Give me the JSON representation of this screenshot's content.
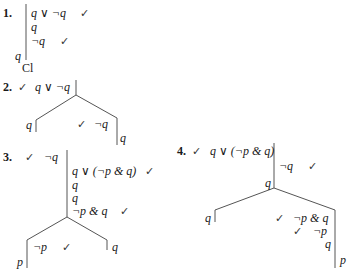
{
  "trees": [
    {
      "number": "1.",
      "nodes": [
        "q ∨ ¬q",
        "q",
        "¬q",
        "q",
        "Cl"
      ],
      "checks": [
        "✓",
        "✓"
      ]
    },
    {
      "number": "2.",
      "root": "q ∨ ¬q",
      "root_check": "✓",
      "left_branch": [
        "q"
      ],
      "right_branch": [
        "¬q",
        "q"
      ],
      "right_check": "✓"
    },
    {
      "number": "3.",
      "nodes": [
        "¬q",
        "q ∨ (¬p & q)",
        "q",
        "q",
        "¬p & q"
      ],
      "checks": [
        "✓",
        "✓",
        "✓"
      ],
      "left_branch": [
        "¬p",
        "p"
      ],
      "left_check": "✓",
      "right_branch": [
        "q"
      ]
    },
    {
      "number": "4.",
      "root": "q ∨ (¬p & q)",
      "root_check": "✓",
      "nodes": [
        "¬q",
        "q"
      ],
      "node_check": "✓",
      "left_branch": [
        "q"
      ],
      "right_branch": [
        "¬p & q",
        "¬p",
        "q",
        "p"
      ],
      "right_checks": [
        "✓",
        "✓"
      ]
    }
  ]
}
